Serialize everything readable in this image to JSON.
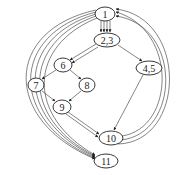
{
  "diagram": {
    "type": "control-flow-graph",
    "nodes": [
      {
        "id": "n1",
        "label": "1",
        "cx": 105,
        "cy": 14,
        "rx": 10,
        "ry": 7
      },
      {
        "id": "n23",
        "label": "2,3",
        "cx": 107,
        "cy": 40,
        "rx": 13,
        "ry": 7
      },
      {
        "id": "n6",
        "label": "6",
        "cx": 63,
        "cy": 65,
        "rx": 9,
        "ry": 7
      },
      {
        "id": "n45",
        "label": "4,5",
        "cx": 149,
        "cy": 68,
        "rx": 13,
        "ry": 7
      },
      {
        "id": "n7",
        "label": "7",
        "cx": 36,
        "cy": 85,
        "rx": 8,
        "ry": 7
      },
      {
        "id": "n8",
        "label": "8",
        "cx": 87,
        "cy": 85,
        "rx": 8,
        "ry": 7
      },
      {
        "id": "n9",
        "label": "9",
        "cx": 62,
        "cy": 107,
        "rx": 9,
        "ry": 7
      },
      {
        "id": "n10",
        "label": "10",
        "cx": 111,
        "cy": 138,
        "rx": 12,
        "ry": 7
      },
      {
        "id": "n11",
        "label": "11",
        "cx": 106,
        "cy": 161,
        "rx": 12,
        "ry": 7
      }
    ],
    "edges": [
      {
        "from": "1",
        "to": "2,3",
        "count": 4
      },
      {
        "from": "2,3",
        "to": "6",
        "count": 2
      },
      {
        "from": "2,3",
        "to": "4,5",
        "count": 1
      },
      {
        "from": "6",
        "to": "7",
        "count": 1
      },
      {
        "from": "6",
        "to": "8",
        "count": 1
      },
      {
        "from": "7",
        "to": "9",
        "count": 1
      },
      {
        "from": "8",
        "to": "9",
        "count": 1
      },
      {
        "from": "9",
        "to": "10",
        "count": 2
      },
      {
        "from": "4,5",
        "to": "10",
        "count": 1
      },
      {
        "from": "10",
        "to": "1",
        "count": 3
      },
      {
        "from": "1",
        "to": "11",
        "count": 5
      }
    ]
  }
}
